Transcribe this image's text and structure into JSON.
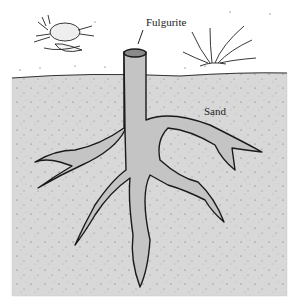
{
  "figure": {
    "labels": {
      "fulgurite": "Fulgurite",
      "sand": "Sand"
    },
    "elements": [
      "crab",
      "beach-grass",
      "sand-cross-section",
      "fulgurite-root-structure"
    ],
    "colors": {
      "background": "#ffffff",
      "sand": "#d9d9d9",
      "fulgurite_fill": "#c4c4c4",
      "outline": "#1a1a1a"
    }
  }
}
